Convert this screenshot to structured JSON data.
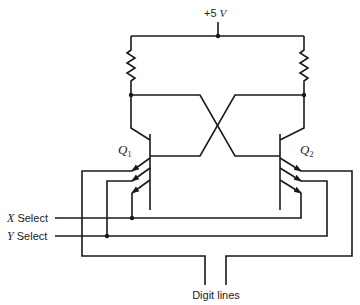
{
  "diagram": {
    "type": "bipolar memory cell schematic",
    "supply": {
      "label_value": "+5",
      "label_unit": "V"
    },
    "transistors": [
      {
        "name": "Q",
        "subscript": "1"
      },
      {
        "name": "Q",
        "subscript": "2"
      }
    ],
    "select_lines": [
      {
        "name": "X",
        "suffix": "Select"
      },
      {
        "name": "Y",
        "suffix": "Select"
      }
    ],
    "output_label": "Digit lines"
  }
}
